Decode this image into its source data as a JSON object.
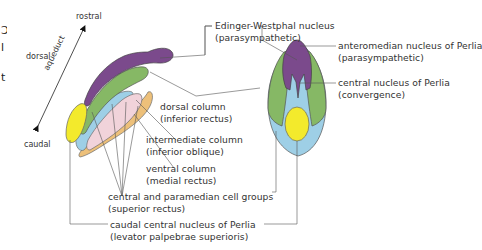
{
  "diagram": {
    "colors": {
      "purple": "#7B4A8C",
      "green": "#86B865",
      "blue": "#9ECFE6",
      "pink": "#F1D3DA",
      "orange": "#EDC07A",
      "yellow": "#F3EA2C",
      "line": "#555555"
    },
    "axis": {
      "rostral": "rostral",
      "caudal": "caudal",
      "dorsal": "dorsal",
      "aqueduct": "aqueduct"
    },
    "labels": {
      "edinger_westphal": {
        "name": "Edinger-Westphal nucleus",
        "sub": "(parasympathetic)"
      },
      "dorsal_column": {
        "name": "dorsal column",
        "sub": "(inferior rectus)"
      },
      "intermediate_column": {
        "name": "intermediate column",
        "sub": "(inferior oblique)"
      },
      "ventral_column": {
        "name": "ventral column",
        "sub": "(medial rectus)"
      },
      "central_paramedian": {
        "name": "central and paramedian cell groups",
        "sub": "(superior rectus)"
      },
      "caudal_central": {
        "name": "caudal central nucleus of Perlia",
        "sub": "(levator palpebrae superioris)"
      },
      "anteromedian": {
        "name": "anteromedian nucleus of Perlia",
        "sub": "(parasympathetic)"
      },
      "central_perlia": {
        "name": "central nucleus of Perlia",
        "sub": "(convergence)"
      }
    },
    "left_edge_cutoff": [
      "Ɔ",
      "l",
      "t"
    ]
  }
}
